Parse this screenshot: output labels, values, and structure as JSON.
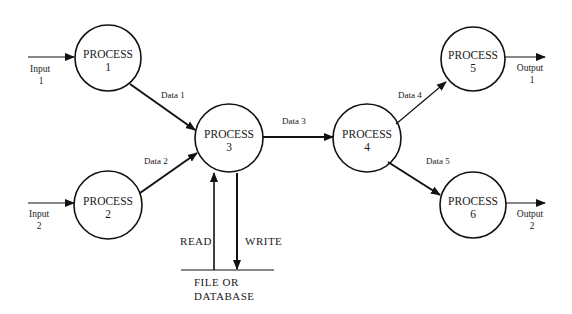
{
  "diagram": {
    "type": "data-flow-diagram",
    "processes": [
      {
        "id": "p1",
        "label": "PROCESS",
        "number": "1"
      },
      {
        "id": "p2",
        "label": "PROCESS",
        "number": "2"
      },
      {
        "id": "p3",
        "label": "PROCESS",
        "number": "3"
      },
      {
        "id": "p4",
        "label": "PROCESS",
        "number": "4"
      },
      {
        "id": "p5",
        "label": "PROCESS",
        "number": "5"
      },
      {
        "id": "p6",
        "label": "PROCESS",
        "number": "6"
      }
    ],
    "inputs": [
      {
        "label": "Input",
        "number": "1"
      },
      {
        "label": "Input",
        "number": "2"
      }
    ],
    "outputs": [
      {
        "label": "Output",
        "number": "1"
      },
      {
        "label": "Output",
        "number": "2"
      }
    ],
    "flows": [
      {
        "label": "Data  1",
        "from": "p1",
        "to": "p3"
      },
      {
        "label": "Data 2",
        "from": "p2",
        "to": "p3"
      },
      {
        "label": "Data 3",
        "from": "p3",
        "to": "p4"
      },
      {
        "label": "Data 4",
        "from": "p4",
        "to": "p5"
      },
      {
        "label": "Data 5",
        "from": "p4",
        "to": "p6"
      }
    ],
    "store": {
      "line1": "FILE  OR",
      "line2": "DATABASE",
      "read_label": "READ",
      "write_label": "WRITE"
    }
  }
}
